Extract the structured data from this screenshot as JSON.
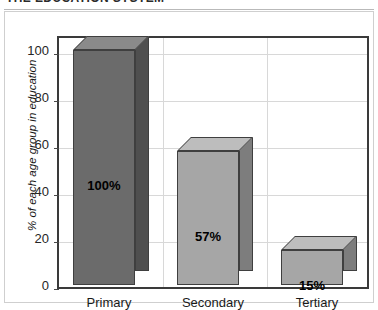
{
  "title_partial": "THE EDUCATION SYSTEM",
  "chart_data": {
    "type": "bar",
    "title": "",
    "xlabel": "",
    "ylabel": "% of each age group in education",
    "categories": [
      "Primary",
      "Secondary",
      "Tertiary"
    ],
    "values": [
      100,
      57,
      15
    ],
    "data_labels": [
      "100%",
      "57%",
      "15%"
    ],
    "ylim": [
      0,
      100
    ],
    "yticks": [
      0,
      20,
      40,
      60,
      80,
      100
    ],
    "ytick_labels": [
      "0",
      "20",
      "40",
      "60",
      "80",
      "100"
    ],
    "grid": true,
    "legend": false,
    "style": "3d-bar-grayscale",
    "series": [
      {
        "name": "% of each age group in education",
        "values": [
          100,
          57,
          15
        ],
        "colors": [
          "#6b6b6b",
          "#a6a6a6",
          "#a6a6a6"
        ]
      }
    ]
  },
  "colors": {
    "bar_dark_front": "#6b6b6b",
    "bar_dark_top": "#8a8a8a",
    "bar_dark_side": "#4f4f4f",
    "bar_light_front": "#a6a6a6",
    "bar_light_top": "#bdbdbd",
    "bar_light_side": "#7d7d7d",
    "plot_border": "#3a3a3a",
    "gridline": "#d8d8d8",
    "text": "#1a1a1a"
  }
}
